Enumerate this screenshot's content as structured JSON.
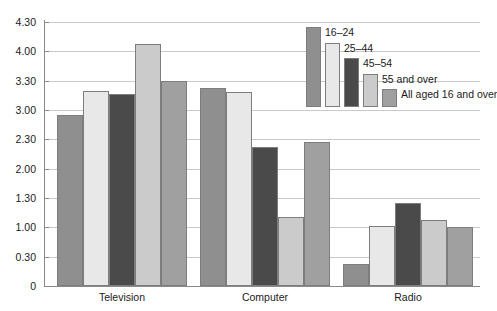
{
  "chart_data": {
    "type": "bar",
    "title": "",
    "subtitle": "",
    "xlabel": "",
    "ylabel": "",
    "categories": [
      "Television",
      "Computer",
      "Radio"
    ],
    "ytick_labels": [
      "0",
      "0.30",
      "1.00",
      "1.30",
      "2.00",
      "2.30",
      "3.00",
      "3.30",
      "4.00",
      "4.30"
    ],
    "ytick_values": [
      0,
      0.5,
      1.0,
      1.5,
      2.0,
      2.5,
      3.0,
      3.5,
      4.0,
      4.5
    ],
    "ylim": [
      0,
      4.5
    ],
    "value_format": "hours.minutes",
    "grid": true,
    "legend_position": "top-right",
    "series": [
      {
        "name": "16–24",
        "color": "#8f8f8f",
        "values": [
          2.55,
          3.22,
          0.23
        ],
        "decimal_values": [
          2.92,
          3.37,
          0.38
        ]
      },
      {
        "name": "25–44",
        "color": "#e8e8e8",
        "values": [
          3.2,
          3.18,
          1.02
        ],
        "decimal_values": [
          3.33,
          3.3,
          1.03
        ]
      },
      {
        "name": "45–54",
        "color": "#4a4a4a",
        "values": [
          3.17,
          2.22,
          1.25
        ],
        "decimal_values": [
          3.28,
          2.37,
          1.42
        ]
      },
      {
        "name": "55 and over",
        "color": "#cbcbcb",
        "values": [
          4.08,
          1.1,
          1.07
        ],
        "decimal_values": [
          4.13,
          1.17,
          1.12
        ]
      },
      {
        "name": "All aged 16 and over",
        "color": "#a0a0a0",
        "values": [
          3.3,
          2.27,
          1.0
        ],
        "decimal_values": [
          3.5,
          2.45,
          1.0
        ]
      }
    ]
  },
  "axis": {
    "tick_0": "0",
    "tick_1": "0.30",
    "tick_2": "1.00",
    "tick_3": "1.30",
    "tick_4": "2.00",
    "tick_5": "2.30",
    "tick_6": "3.00",
    "tick_7": "3.30",
    "tick_8": "4.00",
    "tick_9": "4.30"
  },
  "colors": {
    "gridline": "#c9c9c9",
    "axis": "#8a8a8a",
    "bar_outline": "#7d7d7d",
    "text": "#1b1b1b",
    "background": "#ffffff"
  }
}
